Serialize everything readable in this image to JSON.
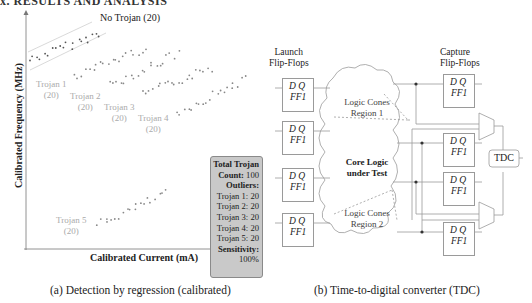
{
  "top_heading_partial": "x. RESULTS AND ANALYSIS",
  "figure_a": {
    "caption": "(a) Detection by regression (calibrated)",
    "stats_box": {
      "line1": "Total Trojan",
      "line2_label": "Count:",
      "line2_value": " 100",
      "line3": "Outliers:",
      "rows": [
        "Trojan 1: 20",
        "Trojan 2: 20",
        "Trojan 3: 20",
        "Trojan 4: 20",
        "Trojan 5: 20"
      ],
      "sens_label": "Sensitivity:",
      "sens_value": "100%"
    }
  },
  "figure_b": {
    "caption": "(b) Time-to-digital converter (TDC)",
    "launch_label_1": "Launch",
    "launch_label_2": "Flip-Flops",
    "capture_label_1": "Capture",
    "capture_label_2": "Flip-Flops",
    "ff_dq": "D Q",
    "ff_name": "FF1",
    "region1_1": "Logic Cones",
    "region1_2": "Region 1",
    "core_1": "Core Logic",
    "core_2": "under Test",
    "region2_1": "Logic Cones",
    "region2_2": "Region 2",
    "tdc": "TDC"
  },
  "chart_data": {
    "type": "scatter",
    "title": "",
    "xlabel": "Calibrated Current (mA)",
    "ylabel": "Calibrated Frequency (MHz)",
    "grid": false,
    "ticks": "none",
    "legend_position": "inline labels",
    "regression_band": "two light gray parallel lines bounding No Trojan cluster",
    "series": [
      {
        "name": "No Trojan",
        "label": "No Trojan (20)",
        "count": 20,
        "color": "#555555",
        "trend": "increasing",
        "x_range_px": [
          30,
          100
        ],
        "y_range_px": [
          60,
          34
        ]
      },
      {
        "name": "Trojan 1",
        "label": "Trojan 1 (20)",
        "count": 20,
        "color": "#888888",
        "trend": "increasing",
        "x_range_px": [
          75,
          145
        ],
        "y_range_px": [
          76,
          48
        ]
      },
      {
        "name": "Trojan 2",
        "label": "Trojan 2 (20)",
        "count": 20,
        "color": "#888888",
        "trend": "increasing",
        "x_range_px": [
          110,
          178
        ],
        "y_range_px": [
          86,
          54
        ]
      },
      {
        "name": "Trojan 3",
        "label": "Trojan 3 (20)",
        "count": 20,
        "color": "#888888",
        "trend": "increasing",
        "x_range_px": [
          143,
          212
        ],
        "y_range_px": [
          95,
          68
        ]
      },
      {
        "name": "Trojan 4",
        "label": "Trojan 4 (20)",
        "count": 20,
        "color": "#888888",
        "trend": "increasing",
        "x_range_px": [
          177,
          245
        ],
        "y_range_px": [
          113,
          79
        ]
      },
      {
        "name": "Trojan 5",
        "label": "Trojan 5 (20)",
        "count": 20,
        "color": "#888888",
        "trend": "increasing",
        "x_range_px": [
          98,
          166
        ],
        "y_range_px": [
          225,
          194
        ]
      }
    ],
    "labels": {
      "no_trojan": "No Trojan (20)",
      "t1a": "Trojan 1",
      "t1b": "(20)",
      "t2a": "Trojan 2",
      "t2b": "(20)",
      "t3a": "Trojan 3",
      "t3b": "(20)",
      "t4a": "Trojan 4",
      "t4b": "(20)",
      "t5a": "Trojan 5",
      "t5b": "(20)"
    }
  }
}
